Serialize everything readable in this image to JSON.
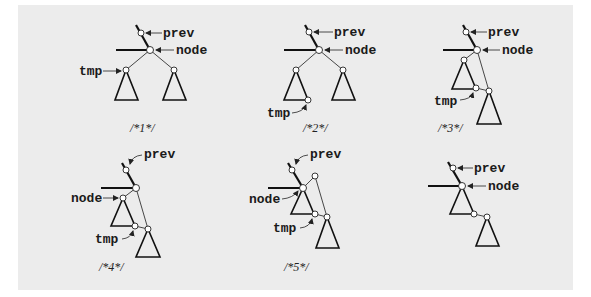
{
  "diagram": {
    "background_color": "#ececec",
    "figures": [
      {
        "id": 1,
        "caption": "/*1*/",
        "labels": {
          "prev": "prev",
          "node": "node",
          "tmp": "tmp"
        }
      },
      {
        "id": 2,
        "caption": "/*2*/",
        "labels": {
          "prev": "prev",
          "node": "node",
          "tmp": "tmp"
        }
      },
      {
        "id": 3,
        "caption": "/*3*/",
        "labels": {
          "prev": "prev",
          "node": "node",
          "tmp": "tmp"
        }
      },
      {
        "id": 4,
        "caption": "/*4*/",
        "labels": {
          "prev": "prev",
          "node": "node",
          "tmp": "tmp"
        }
      },
      {
        "id": 5,
        "caption": "/*5*/",
        "labels": {
          "prev": "prev",
          "node": "node",
          "tmp": "tmp"
        }
      },
      {
        "id": 6,
        "caption": "",
        "labels": {
          "prev": "prev",
          "node": "node"
        }
      }
    ]
  }
}
